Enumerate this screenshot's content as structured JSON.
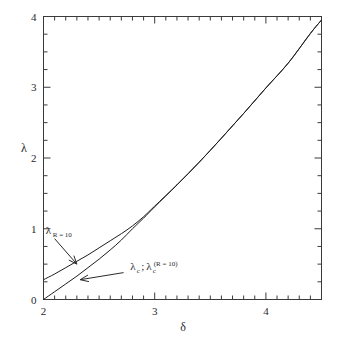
{
  "chart_data": {
    "type": "line",
    "title": "",
    "subtitle": "",
    "xlabel": "δ",
    "ylabel": "λ",
    "xlim": [
      2,
      4.5
    ],
    "ylim": [
      0,
      4
    ],
    "grid": false,
    "legend_position": "none",
    "x_ticks_major": [
      2,
      3,
      4
    ],
    "x_tick_labels": [
      "2",
      "3",
      "4"
    ],
    "x_minor_step": 0.1,
    "y_ticks_major": [
      0,
      1,
      2,
      3,
      4
    ],
    "y_tick_labels": [
      "0",
      "1",
      "2",
      "3",
      "4"
    ],
    "y_minor_step": 0.25,
    "series": [
      {
        "name": "λ (R = 10)",
        "label_text": "λ",
        "label_sub": "R = 10",
        "x": [
          2.0,
          2.1,
          2.2,
          2.3,
          2.4,
          2.5,
          2.6,
          2.7,
          2.8,
          2.9,
          3.0,
          3.2,
          3.4,
          3.6,
          3.8,
          4.0,
          4.2,
          4.4,
          4.5
        ],
        "y": [
          0.28,
          0.36,
          0.45,
          0.54,
          0.63,
          0.73,
          0.83,
          0.93,
          1.04,
          1.17,
          1.32,
          1.62,
          1.94,
          2.28,
          2.63,
          2.99,
          3.34,
          3.76,
          3.95
        ]
      },
      {
        "name": "λ_c ; λ_c (R = 10)",
        "label_text": "λ",
        "label_sub": "c",
        "label_text2": "λ",
        "label_sub2": "c",
        "label_sup2": "(R = 10)",
        "x": [
          2.0,
          2.1,
          2.2,
          2.3,
          2.4,
          2.5,
          2.6,
          2.7,
          2.8,
          2.9,
          3.0,
          3.2,
          3.4,
          3.6,
          3.8,
          4.0,
          4.2,
          4.4,
          4.5
        ],
        "y": [
          0.0,
          0.11,
          0.22,
          0.33,
          0.45,
          0.57,
          0.7,
          0.84,
          1.0,
          1.15,
          1.31,
          1.62,
          1.94,
          2.28,
          2.63,
          2.99,
          3.34,
          3.76,
          3.95
        ]
      }
    ],
    "annotations": [
      {
        "id": "lambda-r10",
        "text": "λ",
        "subscript": "R = 10",
        "text_x": 2.02,
        "text_y": 0.93,
        "arrow_from_x": 2.1,
        "arrow_from_y": 0.86,
        "arrow_to_x": 2.3,
        "arrow_to_y": 0.5
      },
      {
        "id": "lambda-c",
        "text": "λ",
        "subscript": "c",
        "separator": ";",
        "text2": "λ",
        "subscript2": "c",
        "superscript2": "(R = 10)",
        "text_x": 2.78,
        "text_y": 0.42,
        "arrow_from_x": 2.72,
        "arrow_from_y": 0.38,
        "arrow_to_x": 2.33,
        "arrow_to_y": 0.28
      }
    ]
  },
  "axes": {
    "x_title": "δ",
    "y_title": "λ"
  }
}
